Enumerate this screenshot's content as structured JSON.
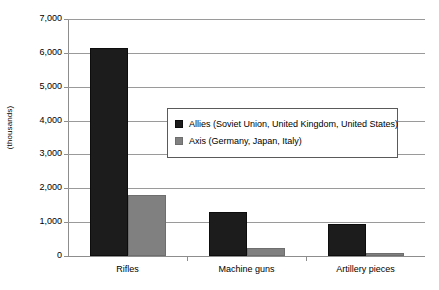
{
  "chart_data": {
    "type": "bar",
    "title": "",
    "subtitle": "",
    "xlabel": "",
    "ylabel": "(thousands)",
    "categories": [
      "Rifles",
      "Machine guns",
      "Artillery pieces"
    ],
    "series": [
      {
        "name": "Allies (Soviet Union, United Kingdom, United States)",
        "color": "#1c1c1c",
        "values": [
          6150,
          1300,
          950
        ]
      },
      {
        "name": "Axis (Germany, Japan, Italy)",
        "color": "#808080",
        "values": [
          1800,
          250,
          80
        ]
      }
    ],
    "ylim": [
      0,
      7000
    ],
    "ytick_values": [
      0,
      1000,
      2000,
      3000,
      4000,
      5000,
      6000,
      7000
    ],
    "ytick_labels": [
      "0",
      "1,000",
      "2,000",
      "3,000",
      "4,000",
      "5,000",
      "6,000",
      "7,000"
    ],
    "grid": true,
    "grid_axis": "y",
    "legend_position": "inside-upper-center-right",
    "legend_entries": [
      "Allies (Soviet Union, United Kingdom, United States)",
      "Axis (Germany, Japan, Italy)"
    ]
  },
  "colors": {
    "allies": "#1c1c1c",
    "axis": "#808080",
    "gridline": "#9a9a9a",
    "axis_line": "#8d8d8d",
    "legend_border": "#5a5a5a",
    "background": "#ffffff"
  }
}
